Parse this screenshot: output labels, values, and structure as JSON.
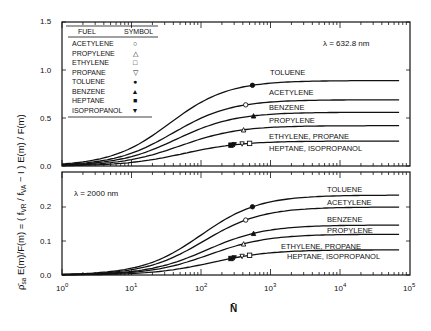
{
  "chart_data": [
    {
      "type": "line",
      "panel": "top",
      "annotation": "λ = 632.8 nm",
      "xscale": "log",
      "xlim": [
        1,
        100000
      ],
      "ylim": [
        0,
        1.5
      ],
      "yticks": [
        "0.0",
        "0.5",
        "1.0",
        "1.5"
      ],
      "grid": false,
      "series": [
        {
          "name": "TOLUENE",
          "plateau": 0.89,
          "marker": "filled-circle",
          "marker_N": 550
        },
        {
          "name": "ACETYLENE",
          "plateau": 0.69,
          "marker": "open-circle",
          "marker_N": 440
        },
        {
          "name": "BENZENE",
          "plateau": 0.56,
          "marker": "filled-triangle",
          "marker_N": 570
        },
        {
          "name": "PROPYLENE",
          "plateau": 0.42,
          "marker": "open-triangle",
          "marker_N": 410
        },
        {
          "name": "ETHYLENE, PROPANE / HEPTANE, ISOPROPANOL",
          "plateau": 0.26,
          "markers": [
            {
              "symbol": "open-square",
              "N": 500
            },
            {
              "symbol": "open-inverted-triangle",
              "N": 390
            },
            {
              "symbol": "filled-inverted-triangle",
              "N": 300
            },
            {
              "symbol": "filled-square",
              "N": 270
            }
          ]
        }
      ]
    },
    {
      "type": "line",
      "panel": "bottom",
      "annotation": "λ = 2000 nm",
      "xscale": "log",
      "xlim": [
        1,
        100000
      ],
      "ylim": [
        0,
        0.27
      ],
      "yticks": [
        "0.0",
        "0.1",
        "0.2"
      ],
      "grid": false,
      "series": [
        {
          "name": "TOLUENE",
          "plateau": 0.235,
          "marker": "filled-circle",
          "marker_N": 550
        },
        {
          "name": "ACETYLENE",
          "plateau": 0.2,
          "marker": "open-circle",
          "marker_N": 440
        },
        {
          "name": "BENZENE",
          "plateau": 0.147,
          "marker": "filled-triangle",
          "marker_N": 570
        },
        {
          "name": "PROPYLENE",
          "plateau": 0.12,
          "marker": "open-triangle",
          "marker_N": 410
        },
        {
          "name": "ETHYLENE, PROPANE / HEPTANE, ISOPROPANOL",
          "plateau": 0.074,
          "markers": [
            {
              "symbol": "open-square",
              "N": 500
            },
            {
              "symbol": "open-inverted-triangle",
              "N": 390
            },
            {
              "symbol": "filled-inverted-triangle",
              "N": 300
            },
            {
              "symbol": "filled-square",
              "N": 270
            }
          ]
        }
      ]
    }
  ],
  "legend": {
    "header_fuel": "FUEL",
    "header_symbol": "SYMBOL",
    "rows": [
      {
        "fuel": "ACETYLENE",
        "symbol": "○"
      },
      {
        "fuel": "PROPYLENE",
        "symbol": "△"
      },
      {
        "fuel": "ETHYLENE",
        "symbol": "□"
      },
      {
        "fuel": "PROPANE",
        "symbol": "▽"
      },
      {
        "fuel": "TOLUENE",
        "symbol": "●"
      },
      {
        "fuel": "BENZENE",
        "symbol": "▲"
      },
      {
        "fuel": "HEPTANE",
        "symbol": "■"
      },
      {
        "fuel": "ISOPROPANOL",
        "symbol": "▼"
      }
    ]
  },
  "labels": {
    "top_lambda": "λ = 632.8 nm",
    "bottom_lambda": "λ = 2000 nm",
    "xlabel": "N̄",
    "ylabel": "ρ̄sa E(m)/F(m) = (fVR / fVA − 1) E(m)/F(m)",
    "ylabel_part1": "ρ̄",
    "ylabel_part1_sub": "sa",
    "ylabel_part2": " E(m)/F(m) = ( f",
    "ylabel_sub_vr": "VR",
    "ylabel_part3": " / f",
    "ylabel_sub_va": "VA",
    "ylabel_part4": " − I ) E(m) / F(m)",
    "xticks": [
      "10",
      "10",
      "10",
      "10",
      "10",
      "10"
    ],
    "xtick_exps": [
      "0",
      "1",
      "2",
      "3",
      "4",
      "5"
    ],
    "top_yticks": [
      "0.0",
      "0.5",
      "1.0",
      "1.5"
    ],
    "bottom_yticks": [
      "0.0",
      "0.1",
      "0.2"
    ],
    "curve_labels_top": [
      "TOLUENE",
      "ACETYLENE",
      "BENZENE",
      "PROPYLENE",
      "ETHYLENE, PROPANE",
      "HEPTANE, ISOPROPANOL"
    ],
    "curve_labels_bottom": [
      "TOLUENE",
      "ACETYLENE",
      "BENZENE",
      "PROPYLENE",
      "ETHYLENE, PROPANE",
      "HEPTANE, ISOPROPANOL"
    ]
  }
}
